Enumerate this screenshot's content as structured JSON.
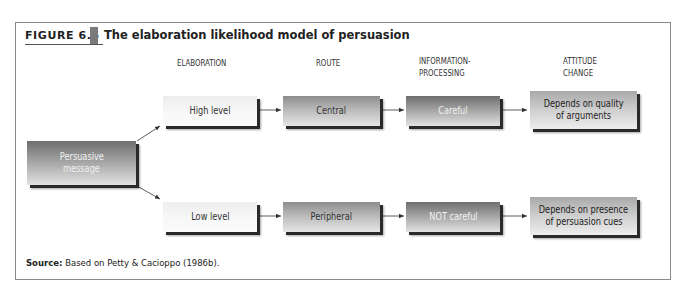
{
  "figure": {
    "label": "FIGURE 6.5",
    "title": "The elaboration likelihood model of persuasion"
  },
  "columns": {
    "elaboration": "ELABORATION",
    "route": "ROUTE",
    "processing_line1": "INFORMATION-",
    "processing_line2": "PROCESSING",
    "attitude_line1": "ATTITUDE",
    "attitude_line2": "CHANGE"
  },
  "start": {
    "line1": "Persuasive",
    "line2": "message"
  },
  "high_path": {
    "elaboration": "High level",
    "route": "Central",
    "processing": "Careful",
    "attitude_line1": "Depends on quality",
    "attitude_line2": "of arguments"
  },
  "low_path": {
    "elaboration": "Low level",
    "route": "Peripheral",
    "processing": "NOT careful",
    "attitude_line1": "Depends on presence",
    "attitude_line2": "of persuasion cues"
  },
  "source": {
    "label": "Source:",
    "text": "Based on Petty & Cacioppo (1986b)."
  }
}
